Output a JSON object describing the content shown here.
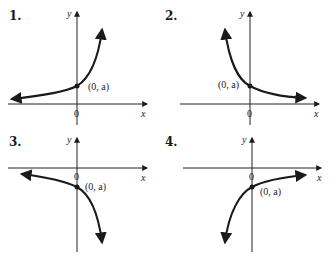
{
  "panels": [
    {
      "number": "1.",
      "x_label": "x",
      "y_label": "y",
      "origin_label": "0",
      "point_label": "(0, a)",
      "description": "increasing exponential, a > 0"
    },
    {
      "number": "2.",
      "x_label": "x",
      "y_label": "y",
      "origin_label": "0",
      "point_label": "(0, a)",
      "description": "decreasing exponential, a > 0"
    },
    {
      "number": "3.",
      "x_label": "x",
      "y_label": "y",
      "origin_label": "0",
      "point_label": "(0, a)",
      "description": "negative increasing-magnitude exponential, a < 0"
    },
    {
      "number": "4.",
      "x_label": "x",
      "y_label": "y",
      "origin_label": "0",
      "point_label": "(0, a)",
      "description": "negative decaying exponential, a < 0"
    }
  ]
}
